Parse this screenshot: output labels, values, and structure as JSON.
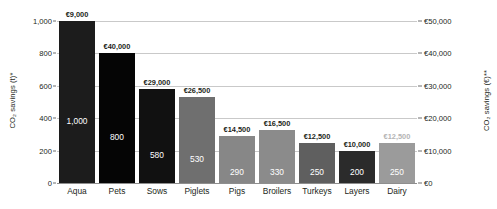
{
  "chart_data": {
    "type": "bar",
    "title": "",
    "xlabel": "",
    "ylabel": "CO₂ savings (t)*",
    "y2label": "CO₂ savings (€)**",
    "categories": [
      "Aqua",
      "Pets",
      "Sows",
      "Piglets",
      "Pigs",
      "Broilers",
      "Turkeys",
      "Layers",
      "Dairy"
    ],
    "series": [
      {
        "name": "CO2 savings (t)",
        "axis": "left",
        "values": [
          1000,
          800,
          580,
          530,
          290,
          330,
          250,
          200,
          250
        ],
        "value_labels": [
          "1,000",
          "800",
          "580",
          "530",
          "290",
          "330",
          "250",
          "200",
          "250"
        ]
      }
    ],
    "point_annotations": {
      "name": "CO2 savings (euro)",
      "labels": [
        "€9,000",
        "€40,000",
        "€29,000",
        "€26,500",
        "€14,500",
        "€16,500",
        "€12,500",
        "€10,000",
        "€12,500"
      ],
      "values": [
        9000,
        40000,
        29000,
        26500,
        14500,
        16500,
        12500,
        10000,
        12500
      ]
    },
    "bar_colors": [
      "#1c1c1c",
      "#050505",
      "#111111",
      "#6f6f6f",
      "#878787",
      "#8b8b8b",
      "#5f5f5f",
      "#2b2b2b",
      "#9b9b9b"
    ],
    "top_label_colors": [
      "#231f20",
      "#231f20",
      "#231f20",
      "#231f20",
      "#231f20",
      "#231f20",
      "#231f20",
      "#231f20",
      "#b4b4b4"
    ],
    "ylim": [
      0,
      1000
    ],
    "y2lim": [
      0,
      50000
    ],
    "yticks": [
      0,
      200,
      400,
      600,
      800,
      1000
    ],
    "ytick_labels": [
      "0",
      "200",
      "400",
      "600",
      "800",
      "1,000"
    ],
    "y2ticks": [
      0,
      10000,
      20000,
      30000,
      40000,
      50000
    ],
    "y2tick_labels": [
      "€0",
      "€10,000",
      "€20,000",
      "€30,000",
      "€40,000",
      "€50,000"
    ],
    "grid": true,
    "legend": "none",
    "background": "#ffffff",
    "gridline_color": "#c9c9c9",
    "text_color": "#231f20"
  }
}
